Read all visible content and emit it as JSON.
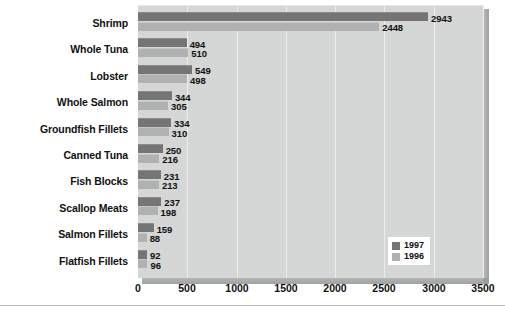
{
  "chart_data": {
    "type": "bar",
    "orientation": "horizontal",
    "title": "",
    "subtitle": "",
    "xlabel": "",
    "ylabel": "",
    "xlim": [
      0,
      3500
    ],
    "xticks": [
      0,
      500,
      1000,
      1500,
      2000,
      2500,
      3000,
      3500
    ],
    "xtick_labels": [
      "0",
      "500",
      "1000",
      "1500",
      "2000",
      "2500",
      "3000",
      "3500"
    ],
    "grid": true,
    "grid_axis": "x",
    "legend_position": "inside-lower-right",
    "categories": [
      "Shrimp",
      "Whole Tuna",
      "Lobster",
      "Whole Salmon",
      "Groundfish Fillets",
      "Canned Tuna",
      "Fish Blocks",
      "Scallop Meats",
      "Salmon Fillets",
      "Flatfish Fillets"
    ],
    "series": [
      {
        "name": "1997",
        "color": "#757575",
        "values": [
          2943,
          494,
          549,
          344,
          334,
          250,
          231,
          237,
          159,
          92
        ],
        "labels": [
          "2943",
          "494",
          "549",
          "344",
          "334",
          "250",
          "231",
          "237",
          "159",
          "92"
        ]
      },
      {
        "name": "1996",
        "color": "#b0b1b1",
        "values": [
          2448,
          510,
          498,
          305,
          310,
          216,
          213,
          198,
          88,
          96
        ],
        "labels": [
          "2448",
          "510",
          "498",
          "305",
          "310",
          "216",
          "213",
          "198",
          "88",
          "96"
        ]
      }
    ]
  },
  "legend": {
    "items": [
      {
        "label": "1997",
        "color": "#757575"
      },
      {
        "label": "1996",
        "color": "#b0b1b1"
      }
    ]
  },
  "colors": {
    "plot_background": "#d5d6d6",
    "page_background": "#ffffff",
    "gridline": "#eceded",
    "text": "#111111",
    "series_1997": "#757575",
    "series_1996": "#b0b1b1"
  }
}
